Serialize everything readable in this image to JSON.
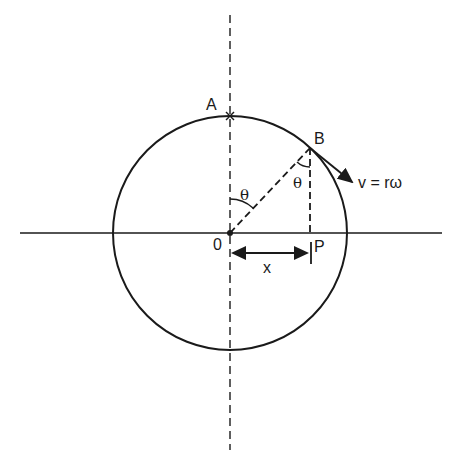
{
  "diagram": {
    "labels": {
      "point_a": "A",
      "point_b": "B",
      "origin": "0",
      "point_p": "P",
      "displacement": "x",
      "angle_at_center": "θ",
      "angle_at_b": "θ",
      "velocity": "v = rω"
    },
    "geometry": {
      "center": [
        230,
        233
      ],
      "radius": 117,
      "point_b": [
        310,
        148
      ],
      "point_p": [
        310,
        233
      ]
    },
    "colors": {
      "stroke": "#1a1a1a",
      "background": "#ffffff"
    }
  }
}
